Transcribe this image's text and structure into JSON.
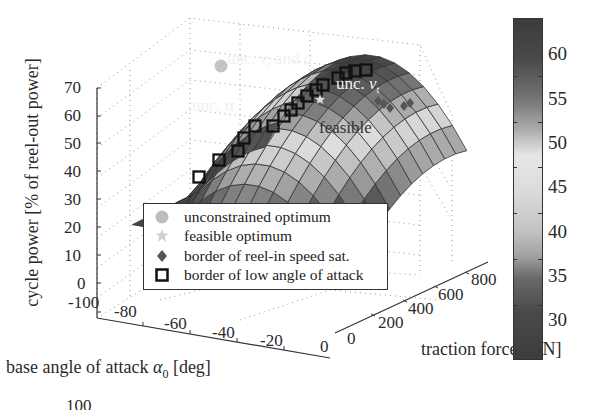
{
  "chart_data": {
    "type": "surface3d",
    "title": "",
    "xlabel": "base angle of attack α0 [deg]",
    "ylabel": "traction force T [N]",
    "zlabel": "cycle power [% of reel-out power]",
    "x_ticks": [
      "-100",
      "-80",
      "-60",
      "-40",
      "-20",
      "0"
    ],
    "y_ticks": [
      "0",
      "200",
      "400",
      "600",
      "800"
    ],
    "z_ticks": [
      "0",
      "10",
      "20",
      "30",
      "40",
      "50",
      "60",
      "70"
    ],
    "xlim": [
      -100,
      0
    ],
    "ylim": [
      0,
      900
    ],
    "zlim": [
      0,
      70
    ],
    "grid": true,
    "colorbar": {
      "ticks": [
        "30",
        "35",
        "40",
        "45",
        "50",
        "55",
        "60"
      ],
      "range": [
        28,
        64
      ],
      "colormap": "grayscale (dark-light-dark)"
    },
    "legend": {
      "position": "inside, lower center",
      "entries": [
        {
          "label": "unconstrained optimum",
          "marker": "filled circle",
          "color": "#bdbdbd"
        },
        {
          "label": "feasible optimum",
          "marker": "star",
          "color": "#cfcfcf"
        },
        {
          "label": "border of reel-in speed sat.",
          "marker": "diamond",
          "color": "#555555"
        },
        {
          "label": "border of low angle of attack",
          "marker": "open square",
          "color": "#111111"
        }
      ]
    },
    "annotations": [
      {
        "text": "unc. vt and α",
        "near": "peak of surface"
      },
      {
        "text": "unc. vt",
        "near": "upper right of surface"
      },
      {
        "text": "unc. α",
        "near": "left center of surface"
      },
      {
        "text": "feasible",
        "near": "center right of surface"
      }
    ],
    "surface_summary": {
      "peak_power_percent": 63,
      "min_visible_power_percent": 30,
      "shape": "dome, maximum near α0 ≈ -50 deg and high T"
    }
  },
  "labels": {
    "zlabel": "cycle power [% of reel-out power]",
    "xlabel_prefix": "base angle of attack ",
    "xlabel_sym": "α",
    "xlabel_sub": "0",
    "xlabel_unit": " [deg]",
    "tlabel_prefix": "traction force ",
    "tlabel_sym": "T",
    "tlabel_unit": " [N]",
    "bottom_cut": "100"
  },
  "annotations": {
    "peak_a": "unc. ",
    "peak_v": "v",
    "peak_sub": "t",
    "peak_b": " and ",
    "peak_alpha": "α",
    "right_a": "unc. ",
    "right_v": "v",
    "right_sub": "t",
    "left": "unc. α",
    "feasible": "feasible"
  },
  "legend": {
    "item0": "unconstrained optimum",
    "item1": "feasible optimum",
    "item2": "border of reel-in speed sat.",
    "item3": "border of low angle of attack"
  },
  "z_ticks": [
    "70",
    "60",
    "50",
    "40",
    "30",
    "20",
    "10",
    "0"
  ],
  "x_ticks": [
    "-100",
    "-80",
    "-60",
    "-40",
    "-20",
    "0"
  ],
  "t_ticks": [
    "0",
    "200",
    "400",
    "600",
    "800"
  ],
  "cb_ticks": [
    "60",
    "55",
    "50",
    "45",
    "40",
    "35",
    "30"
  ]
}
